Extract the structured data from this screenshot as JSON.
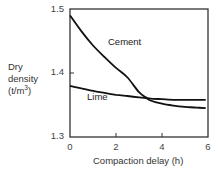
{
  "chart_data": {
    "type": "line",
    "title": "",
    "xlabel": "Compaction delay (h)",
    "ylabel_lines": [
      "Dry",
      "density",
      "(t/m"
    ],
    "ylabel_sup": "3",
    "ylabel_close": ")",
    "xlim": [
      0,
      6
    ],
    "ylim": [
      1.3,
      1.5
    ],
    "x_ticks": [
      "0",
      "2",
      "4",
      "6"
    ],
    "y_ticks": [
      "1.3",
      "1.4",
      "1.5"
    ],
    "grid": false,
    "legend": "inline labels",
    "series": [
      {
        "name": "Cement",
        "x": [
          0,
          0.5,
          1,
          1.5,
          2,
          2.5,
          3,
          3.3,
          3.5,
          4,
          4.5,
          5,
          5.5,
          5.9
        ],
        "values": [
          1.49,
          1.465,
          1.443,
          1.425,
          1.408,
          1.393,
          1.37,
          1.362,
          1.357,
          1.352,
          1.349,
          1.347,
          1.346,
          1.345
        ]
      },
      {
        "name": "Lime",
        "x": [
          0,
          0.5,
          1,
          1.5,
          2,
          2.5,
          3,
          3.3,
          3.5,
          4,
          4.5,
          5,
          5.5,
          5.9
        ],
        "values": [
          1.38,
          1.376,
          1.372,
          1.369,
          1.366,
          1.364,
          1.362,
          1.361,
          1.36,
          1.359,
          1.358,
          1.358,
          1.358,
          1.358
        ]
      }
    ],
    "annotations": [
      {
        "text": "Cement",
        "x": 1.7,
        "y": 1.445
      },
      {
        "text": "Lime",
        "x": 1.1,
        "y": 1.36
      }
    ]
  }
}
